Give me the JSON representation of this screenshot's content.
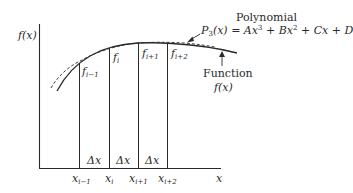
{
  "diagram": {
    "y_axis_label": "f(x)",
    "x_axis_label": "x",
    "polynomial": {
      "title": "Polynomial",
      "equation_lhs": "P",
      "equation_lhs_sub": "3",
      "equation_rest_1": "(x) = Ax",
      "equation_sup_1": "3",
      "equation_rest_2": " + Bx",
      "equation_sup_2": "2",
      "equation_rest_3": " + Cx + D"
    },
    "function": {
      "title": "Function",
      "label": "f(x)"
    },
    "f_labels": [
      {
        "base": "f",
        "sub": "i−1"
      },
      {
        "base": "f",
        "sub": "i"
      },
      {
        "base": "f",
        "sub": "i+1"
      },
      {
        "base": "f",
        "sub": "i+2"
      }
    ],
    "x_labels": [
      {
        "base": "x",
        "sub": "i−1"
      },
      {
        "base": "x",
        "sub": "i"
      },
      {
        "base": "x",
        "sub": "i+1"
      },
      {
        "base": "x",
        "sub": "i+2"
      }
    ],
    "delta_labels": [
      "Δx",
      "Δx",
      "Δx"
    ],
    "colors": {
      "line": "#2a2a2a",
      "background": "#ffffff"
    }
  }
}
